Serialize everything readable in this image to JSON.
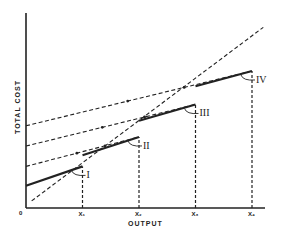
{
  "chart_data": {
    "type": "line",
    "title": "",
    "xlabel": "OUTPUT",
    "ylabel": "TOTAL COST",
    "origin_label": "0",
    "x_ticks": [
      {
        "key": "x1",
        "label": "X₁",
        "value": 1
      },
      {
        "key": "x2",
        "label": "X₂",
        "value": 2
      },
      {
        "key": "x3",
        "label": "X₃",
        "value": 3
      },
      {
        "key": "x4",
        "label": "X₄",
        "value": 4
      }
    ],
    "xlim": [
      0,
      4.4
    ],
    "ylim": [
      0,
      10
    ],
    "grid": false,
    "legend": "none",
    "series": [
      {
        "name": "Plant I cost curve",
        "style": "solid",
        "label": "I",
        "points": [
          [
            0,
            1.1
          ],
          [
            1,
            2.05
          ]
        ]
      },
      {
        "name": "Plant II cost curve",
        "style": "solid",
        "label": "II",
        "points": [
          [
            1,
            2.6
          ],
          [
            2,
            3.5
          ]
        ]
      },
      {
        "name": "Plant III cost curve",
        "style": "solid",
        "label": "III",
        "points": [
          [
            2,
            4.3
          ],
          [
            3,
            5.1
          ]
        ]
      },
      {
        "name": "Plant IV cost curve",
        "style": "solid",
        "label": "IV",
        "points": [
          [
            3,
            6.0
          ],
          [
            4,
            6.75
          ]
        ]
      },
      {
        "name": "Dashed line from II intercept",
        "style": "dashed",
        "points": [
          [
            0,
            2.05
          ],
          [
            2,
            3.5
          ]
        ]
      },
      {
        "name": "Dashed line from III intercept",
        "style": "dashed",
        "points": [
          [
            0,
            3.05
          ],
          [
            3,
            5.1
          ]
        ]
      },
      {
        "name": "Dashed line from IV intercept",
        "style": "dashed",
        "points": [
          [
            0,
            4.05
          ],
          [
            4,
            6.75
          ]
        ]
      },
      {
        "name": "Long-run ray",
        "style": "dashed",
        "points": [
          [
            0.1,
            0.35
          ],
          [
            4.2,
            8.9
          ]
        ]
      }
    ],
    "vertical_guides": [
      1,
      2,
      3,
      4
    ],
    "annotations": [
      {
        "text": "I",
        "at_x": 1
      },
      {
        "text": "II",
        "at_x": 2
      },
      {
        "text": "III",
        "at_x": 3
      },
      {
        "text": "IV",
        "at_x": 4
      }
    ]
  }
}
